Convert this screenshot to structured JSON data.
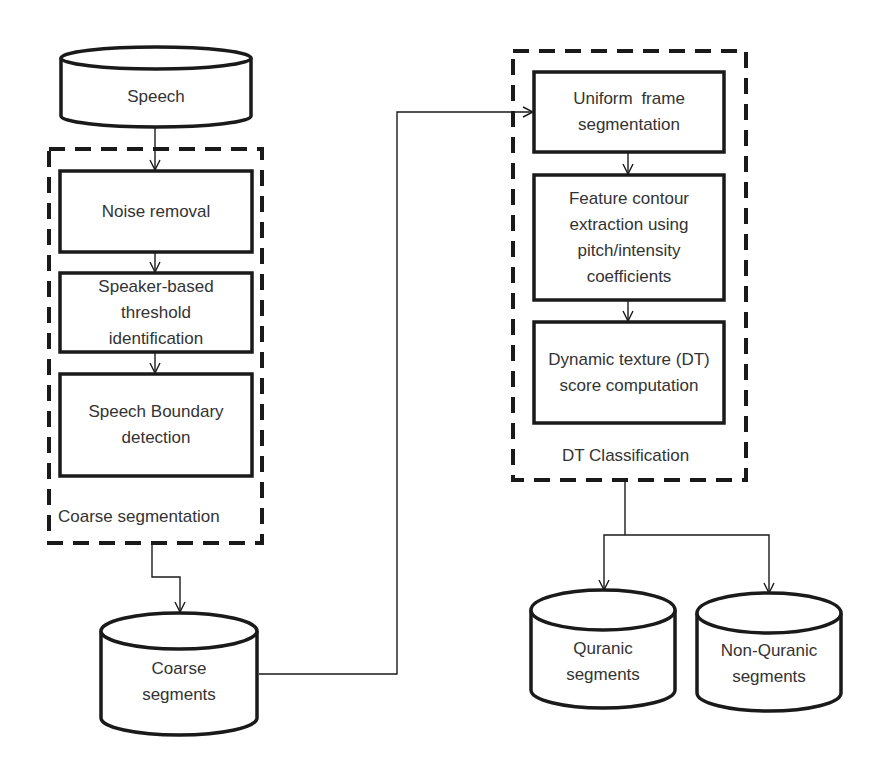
{
  "diagram": {
    "type": "flowchart",
    "colors": {
      "stroke": "#1a1a1a",
      "text": "#333333",
      "background": "#ffffff"
    },
    "nodes": {
      "speech": {
        "label": "Speech",
        "shape": "cylinder"
      },
      "noise_removal": {
        "label": "Noise removal",
        "shape": "rectangle"
      },
      "speaker_threshold": {
        "label": "Speaker-based threshold identification",
        "shape": "rectangle"
      },
      "speech_boundary": {
        "label": "Speech Boundary detection",
        "shape": "rectangle"
      },
      "coarse_segments": {
        "label": "Coarse segments",
        "shape": "cylinder"
      },
      "uniform_frame": {
        "label": "Uniform frame segmentation",
        "shape": "rectangle"
      },
      "feature_contour": {
        "label": "Feature contour extraction using pitch/intensity coefficients",
        "shape": "rectangle"
      },
      "dt_score": {
        "label": "Dynamic texture (DT) score computation",
        "shape": "rectangle"
      },
      "quranic": {
        "label": "Quranic segments",
        "shape": "cylinder"
      },
      "non_quranic": {
        "label": "Non-Quranic segments",
        "shape": "cylinder"
      }
    },
    "groups": {
      "coarse_segmentation": {
        "label": "Coarse segmentation",
        "style": "dashed"
      },
      "dt_classification": {
        "label": "DT Classification",
        "style": "dashed"
      }
    },
    "edges": [
      {
        "from": "Speech",
        "to": "Noise removal"
      },
      {
        "from": "Noise removal",
        "to": "Speaker-based threshold identification"
      },
      {
        "from": "Speaker-based threshold identification",
        "to": "Speech Boundary detection"
      },
      {
        "from": "Coarse segmentation",
        "to": "Coarse segments"
      },
      {
        "from": "Coarse segments",
        "to": "Uniform frame segmentation"
      },
      {
        "from": "Uniform frame segmentation",
        "to": "Feature contour extraction using pitch/intensity coefficients"
      },
      {
        "from": "Feature contour extraction using pitch/intensity coefficients",
        "to": "Dynamic texture (DT) score computation"
      },
      {
        "from": "DT Classification",
        "to": "Quranic segments"
      },
      {
        "from": "DT Classification",
        "to": "Non-Quranic segments"
      }
    ]
  }
}
